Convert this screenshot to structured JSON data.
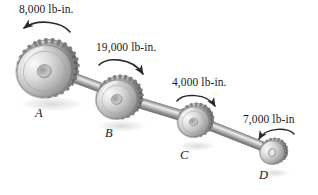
{
  "figure": {
    "background_color": "#ffffff",
    "ink_color": "#1a1a1a"
  },
  "torques": [
    {
      "id": "A",
      "label": "8,000 lb-in.",
      "magnitude": 8000,
      "unit": "lb-in.",
      "gear": "A",
      "arrow_direction": "counterclockwise"
    },
    {
      "id": "B",
      "label": "19,000 lb-in.",
      "magnitude": 19000,
      "unit": "lb-in.",
      "gear": "B",
      "arrow_direction": "clockwise"
    },
    {
      "id": "C",
      "label": "4,000 lb-in.",
      "magnitude": 4000,
      "unit": "lb-in.",
      "gear": "C",
      "arrow_direction": "clockwise"
    },
    {
      "id": "D",
      "label": "7,000 lb-in",
      "magnitude": 7000,
      "unit": "lb-in",
      "gear": "D",
      "arrow_direction": "counterclockwise"
    }
  ],
  "gears": [
    {
      "id": "A",
      "label": "A",
      "center_x": 48,
      "center_y": 68,
      "radius": 31
    },
    {
      "id": "B",
      "label": "B",
      "center_x": 120,
      "center_y": 97,
      "radius": 23
    },
    {
      "id": "C",
      "label": "C",
      "center_x": 196,
      "center_y": 120,
      "radius": 18
    },
    {
      "id": "D",
      "label": "D",
      "center_x": 274,
      "center_y": 151,
      "radius": 14
    }
  ],
  "shaft": {
    "start_x": 44,
    "start_y": 66,
    "end_x": 286,
    "end_y": 156,
    "color_light": "#d8d8d8",
    "color_mid": "#a6a6a6",
    "color_dark": "#6f6f6f"
  },
  "colors": {
    "gear_highlight": "#f1f1f1",
    "gear_mid": "#b9b9b9",
    "gear_shadow": "#676767",
    "tooth_dark": "#585858",
    "arrow": "#2a2a2a",
    "shadow": "#e6e6e6"
  }
}
